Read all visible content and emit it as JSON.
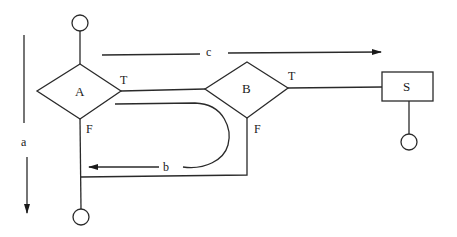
{
  "diagram": {
    "type": "flowchart",
    "nodes": [
      {
        "id": "start",
        "shape": "circle",
        "label": ""
      },
      {
        "id": "A",
        "shape": "diamond",
        "label": "A"
      },
      {
        "id": "B",
        "shape": "diamond",
        "label": "B"
      },
      {
        "id": "S",
        "shape": "rectangle",
        "label": "S"
      },
      {
        "id": "end_S",
        "shape": "circle",
        "label": ""
      },
      {
        "id": "end",
        "shape": "circle",
        "label": ""
      }
    ],
    "edges": [
      {
        "from": "start",
        "to": "A",
        "label": ""
      },
      {
        "from": "A",
        "to": "B",
        "label": "T"
      },
      {
        "from": "A",
        "to": "end",
        "label": "F"
      },
      {
        "from": "B",
        "to": "S",
        "label": "T"
      },
      {
        "from": "B",
        "to": "end",
        "label": "F"
      },
      {
        "from": "S",
        "to": "end_S",
        "label": ""
      }
    ],
    "annotations": {
      "a": "a",
      "b": "b",
      "c": "c"
    },
    "branch_labels": {
      "A_true": "T",
      "A_false": "F",
      "B_true": "T",
      "B_false": "F"
    }
  }
}
